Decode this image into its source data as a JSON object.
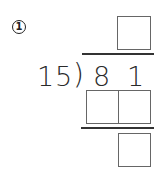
{
  "problem": {
    "number_label": "1",
    "divisor": [
      "1",
      "5"
    ],
    "dividend": [
      "8",
      "1"
    ],
    "bracket": ")"
  },
  "answer_boxes": {
    "quotient": [
      ""
    ],
    "product": [
      "",
      ""
    ],
    "remainder": [
      ""
    ]
  }
}
